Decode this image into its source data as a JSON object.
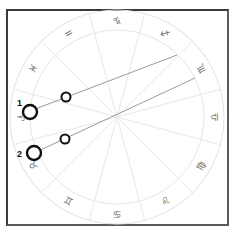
{
  "wheel": {
    "center": [
      117,
      117
    ],
    "outer_radius": 107,
    "inner_radius": 87,
    "ring_color": "#e6e6e6",
    "spoke_color": "#e8e8e8",
    "orientation": "rotated 180deg (glyphs upside-down)",
    "signs": [
      {
        "name": "Capricorn",
        "glyph": "♑",
        "angle_deg": 270
      },
      {
        "name": "Sagittarius",
        "glyph": "♐",
        "angle_deg": 300
      },
      {
        "name": "Scorpio",
        "glyph": "♏",
        "angle_deg": 330
      },
      {
        "name": "Libra",
        "glyph": "♎",
        "angle_deg": 0
      },
      {
        "name": "Virgo",
        "glyph": "♍",
        "angle_deg": 30
      },
      {
        "name": "Leo",
        "glyph": "♌",
        "angle_deg": 60
      },
      {
        "name": "Cancer",
        "glyph": "♋",
        "angle_deg": 90
      },
      {
        "name": "Gemini",
        "glyph": "♊",
        "angle_deg": 120
      },
      {
        "name": "Taurus",
        "glyph": "♉",
        "angle_deg": 150
      },
      {
        "name": "Aries",
        "glyph": "♈",
        "angle_deg": 180
      },
      {
        "name": "Pisces",
        "glyph": "♓",
        "angle_deg": 210
      },
      {
        "name": "Aquarius",
        "glyph": "♒",
        "angle_deg": 240
      }
    ]
  },
  "lines": [
    {
      "label": "1",
      "from": [
        177,
        55
      ],
      "to": [
        30,
        111
      ],
      "color": "#9a9a9a"
    },
    {
      "label": "2",
      "from": [
        195,
        78
      ],
      "to": [
        34,
        153
      ],
      "color": "#9a9a9a"
    }
  ],
  "markers": [
    {
      "label": "1",
      "big": {
        "cx": 30,
        "cy": 112,
        "r": 7
      },
      "small": {
        "cx": 66,
        "cy": 97,
        "r": 4.5
      },
      "label_pos": [
        17,
        106
      ]
    },
    {
      "label": "2",
      "big": {
        "cx": 34,
        "cy": 153,
        "r": 7
      },
      "small": {
        "cx": 65,
        "cy": 139,
        "r": 4.5
      },
      "label_pos": [
        17,
        157
      ]
    }
  ]
}
